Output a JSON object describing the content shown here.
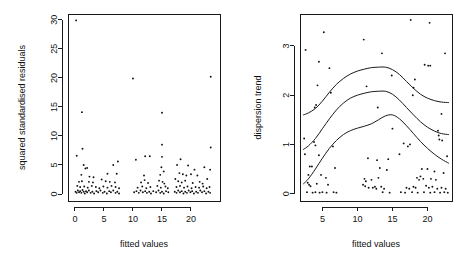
{
  "figure": {
    "title": "",
    "panel_count": 2,
    "background_color": "#ffffff",
    "foreground_color": "#111111"
  },
  "chart_data": [
    {
      "id": "left-panel",
      "type": "scatter",
      "title": "",
      "xlabel": "fitted values",
      "ylabel": "squared standardised residuals",
      "xlim": [
        -1.2,
        25.0
      ],
      "ylim": [
        -1.2,
        31.0
      ],
      "xticks": [
        0,
        5,
        10,
        15,
        20
      ],
      "yticks": [
        0,
        5,
        10,
        15,
        20,
        25,
        30
      ],
      "xticklabels": [
        "0",
        "5",
        "10",
        "15",
        "20"
      ],
      "yticklabels": [
        "0",
        "5",
        "10",
        "15",
        "20",
        "25",
        "30"
      ],
      "grid": false,
      "legend": "none",
      "point_marker": "dot",
      "points": [
        [
          0.2,
          29.9
        ],
        [
          1.2,
          14.1
        ],
        [
          1.3,
          7.8
        ],
        [
          0.3,
          6.6
        ],
        [
          10.0,
          19.9
        ],
        [
          15.0,
          14.0
        ],
        [
          23.4,
          20.2
        ],
        [
          23.4,
          8.0
        ],
        [
          15.0,
          8.5
        ],
        [
          12.1,
          6.5
        ],
        [
          12.9,
          6.5
        ],
        [
          15.0,
          6.4
        ],
        [
          10.5,
          5.9
        ],
        [
          7.4,
          5.6
        ],
        [
          1.5,
          5.0
        ],
        [
          6.6,
          5.0
        ],
        [
          18.2,
          6.0
        ],
        [
          23.3,
          4.2
        ],
        [
          2.1,
          4.5
        ],
        [
          1.8,
          4.4
        ],
        [
          17.6,
          5.0
        ],
        [
          19.5,
          4.9
        ],
        [
          20.6,
          4.2
        ],
        [
          22.3,
          4.6
        ],
        [
          14.9,
          4.6
        ],
        [
          15.3,
          3.9
        ],
        [
          5.6,
          3.5
        ],
        [
          7.2,
          3.5
        ],
        [
          1.1,
          3.3
        ],
        [
          2.5,
          3.0
        ],
        [
          3.2,
          2.9
        ],
        [
          18.0,
          3.6
        ],
        [
          18.6,
          3.4
        ],
        [
          19.2,
          3.2
        ],
        [
          20.0,
          3.4
        ],
        [
          21.1,
          3.2
        ],
        [
          11.9,
          3.2
        ],
        [
          14.7,
          3.3
        ],
        [
          17.3,
          2.6
        ],
        [
          22.8,
          2.6
        ],
        [
          0.7,
          2.1
        ],
        [
          1.2,
          2.2
        ],
        [
          2.4,
          2.1
        ],
        [
          3.1,
          2.0
        ],
        [
          4.6,
          2.5
        ],
        [
          5.3,
          2.2
        ],
        [
          6.0,
          2.1
        ],
        [
          6.9,
          2.0
        ],
        [
          11.4,
          2.0
        ],
        [
          12.0,
          2.4
        ],
        [
          12.6,
          1.9
        ],
        [
          14.5,
          2.3
        ],
        [
          15.1,
          2.1
        ],
        [
          15.4,
          1.8
        ],
        [
          17.8,
          2.2
        ],
        [
          18.4,
          2.0
        ],
        [
          19.0,
          2.3
        ],
        [
          20.3,
          1.9
        ],
        [
          21.5,
          2.1
        ],
        [
          22.0,
          1.8
        ],
        [
          0.4,
          1.4
        ],
        [
          0.9,
          1.2
        ],
        [
          1.6,
          1.3
        ],
        [
          2.2,
          1.1
        ],
        [
          2.9,
          1.4
        ],
        [
          3.6,
          1.2
        ],
        [
          4.2,
          1.0
        ],
        [
          4.9,
          1.3
        ],
        [
          5.6,
          1.1
        ],
        [
          6.3,
          1.4
        ],
        [
          7.0,
          1.2
        ],
        [
          7.6,
          1.0
        ],
        [
          10.8,
          1.1
        ],
        [
          11.6,
          1.3
        ],
        [
          12.3,
          1.0
        ],
        [
          13.0,
          1.2
        ],
        [
          14.2,
          1.4
        ],
        [
          14.8,
          1.1
        ],
        [
          15.6,
          1.3
        ],
        [
          16.0,
          1.0
        ],
        [
          17.5,
          1.2
        ],
        [
          18.1,
          1.4
        ],
        [
          18.8,
          1.1
        ],
        [
          19.4,
          1.3
        ],
        [
          20.1,
          1.0
        ],
        [
          20.8,
          1.2
        ],
        [
          21.4,
          1.1
        ],
        [
          22.1,
          1.3
        ],
        [
          22.7,
          1.0
        ],
        [
          23.2,
          1.2
        ],
        [
          0.1,
          0.4
        ],
        [
          0.3,
          0.2
        ],
        [
          0.5,
          0.6
        ],
        [
          0.7,
          0.3
        ],
        [
          0.9,
          0.5
        ],
        [
          1.1,
          0.2
        ],
        [
          1.3,
          0.7
        ],
        [
          1.5,
          0.4
        ],
        [
          1.7,
          0.1
        ],
        [
          1.9,
          0.5
        ],
        [
          2.1,
          0.3
        ],
        [
          2.4,
          0.6
        ],
        [
          2.7,
          0.2
        ],
        [
          3.0,
          0.4
        ],
        [
          3.3,
          0.1
        ],
        [
          3.7,
          0.5
        ],
        [
          4.0,
          0.3
        ],
        [
          4.4,
          0.6
        ],
        [
          4.8,
          0.2
        ],
        [
          5.1,
          0.4
        ],
        [
          5.5,
          0.1
        ],
        [
          5.9,
          0.5
        ],
        [
          6.2,
          0.3
        ],
        [
          6.6,
          0.6
        ],
        [
          7.0,
          0.2
        ],
        [
          7.3,
          0.4
        ],
        [
          7.6,
          0.1
        ],
        [
          10.2,
          0.3
        ],
        [
          10.6,
          0.5
        ],
        [
          11.0,
          0.2
        ],
        [
          11.3,
          0.6
        ],
        [
          11.7,
          0.3
        ],
        [
          12.1,
          0.5
        ],
        [
          12.4,
          0.2
        ],
        [
          12.8,
          0.4
        ],
        [
          13.1,
          0.1
        ],
        [
          13.5,
          0.5
        ],
        [
          14.0,
          0.3
        ],
        [
          14.4,
          0.6
        ],
        [
          14.7,
          0.2
        ],
        [
          15.0,
          0.4
        ],
        [
          15.3,
          0.1
        ],
        [
          15.7,
          0.5
        ],
        [
          16.1,
          0.3
        ],
        [
          17.2,
          0.4
        ],
        [
          17.5,
          0.2
        ],
        [
          17.8,
          0.6
        ],
        [
          18.1,
          0.3
        ],
        [
          18.4,
          0.5
        ],
        [
          18.7,
          0.1
        ],
        [
          19.0,
          0.4
        ],
        [
          19.3,
          0.2
        ],
        [
          19.6,
          0.6
        ],
        [
          19.9,
          0.3
        ],
        [
          20.2,
          0.5
        ],
        [
          20.5,
          0.1
        ],
        [
          20.9,
          0.4
        ],
        [
          21.2,
          0.2
        ],
        [
          21.6,
          0.6
        ],
        [
          21.9,
          0.3
        ],
        [
          22.3,
          0.5
        ],
        [
          22.6,
          0.1
        ],
        [
          23.0,
          0.4
        ],
        [
          23.3,
          0.2
        ]
      ]
    },
    {
      "id": "right-panel",
      "type": "scatter",
      "title": "",
      "xlabel": "fitted values",
      "ylabel": "dispersion trend",
      "xlim": [
        1.8,
        23.5
      ],
      "ylim": [
        -0.15,
        3.65
      ],
      "xticks": [
        5,
        10,
        15,
        20
      ],
      "yticks": [
        0,
        1,
        2,
        3
      ],
      "xticklabels": [
        "5",
        "10",
        "15",
        "20"
      ],
      "yticklabels": [
        "0",
        "1",
        "2",
        "3"
      ],
      "grid": false,
      "legend": "none",
      "point_marker": "dot",
      "curve_count": 3,
      "curves": [
        {
          "name": "upper-quantile-trend",
          "points": [
            [
              2.3,
              1.6
            ],
            [
              3.0,
              1.64
            ],
            [
              4.0,
              1.73
            ],
            [
              5.0,
              1.88
            ],
            [
              6.0,
              2.06
            ],
            [
              7.0,
              2.22
            ],
            [
              8.0,
              2.34
            ],
            [
              9.0,
              2.43
            ],
            [
              10.0,
              2.49
            ],
            [
              11.0,
              2.53
            ],
            [
              12.0,
              2.56
            ],
            [
              13.0,
              2.57
            ],
            [
              14.0,
              2.57
            ],
            [
              15.0,
              2.52
            ],
            [
              16.0,
              2.42
            ],
            [
              17.0,
              2.28
            ],
            [
              18.0,
              2.14
            ],
            [
              19.0,
              2.02
            ],
            [
              20.0,
              1.94
            ],
            [
              21.0,
              1.89
            ],
            [
              22.0,
              1.86
            ],
            [
              23.0,
              1.85
            ]
          ]
        },
        {
          "name": "median-trend",
          "points": [
            [
              2.3,
              0.9
            ],
            [
              3.0,
              0.97
            ],
            [
              4.0,
              1.12
            ],
            [
              5.0,
              1.32
            ],
            [
              6.0,
              1.52
            ],
            [
              7.0,
              1.7
            ],
            [
              8.0,
              1.84
            ],
            [
              9.0,
              1.94
            ],
            [
              10.0,
              2.0
            ],
            [
              11.0,
              2.04
            ],
            [
              12.0,
              2.07
            ],
            [
              13.0,
              2.08
            ],
            [
              14.0,
              2.08
            ],
            [
              15.0,
              2.02
            ],
            [
              16.0,
              1.9
            ],
            [
              17.0,
              1.75
            ],
            [
              18.0,
              1.6
            ],
            [
              19.0,
              1.46
            ],
            [
              20.0,
              1.35
            ],
            [
              21.0,
              1.27
            ],
            [
              22.0,
              1.22
            ],
            [
              23.0,
              1.2
            ]
          ]
        },
        {
          "name": "lower-quantile-trend",
          "points": [
            [
              2.3,
              0.2
            ],
            [
              3.0,
              0.3
            ],
            [
              4.0,
              0.5
            ],
            [
              5.0,
              0.72
            ],
            [
              6.0,
              0.92
            ],
            [
              7.0,
              1.08
            ],
            [
              8.0,
              1.2
            ],
            [
              9.0,
              1.28
            ],
            [
              10.0,
              1.33
            ],
            [
              11.0,
              1.37
            ],
            [
              12.0,
              1.42
            ],
            [
              13.0,
              1.5
            ],
            [
              14.0,
              1.58
            ],
            [
              15.0,
              1.6
            ],
            [
              16.0,
              1.52
            ],
            [
              17.0,
              1.38
            ],
            [
              18.0,
              1.22
            ],
            [
              19.0,
              1.06
            ],
            [
              20.0,
              0.92
            ],
            [
              21.0,
              0.8
            ],
            [
              22.0,
              0.7
            ],
            [
              23.0,
              0.62
            ]
          ]
        }
      ],
      "points": [
        [
          17.6,
          3.53
        ],
        [
          20.3,
          3.47
        ],
        [
          5.2,
          3.28
        ],
        [
          10.9,
          3.13
        ],
        [
          2.6,
          2.92
        ],
        [
          13.5,
          2.85
        ],
        [
          22.5,
          2.85
        ],
        [
          4.5,
          2.68
        ],
        [
          19.6,
          2.62
        ],
        [
          20.1,
          2.6
        ],
        [
          20.4,
          2.6
        ],
        [
          6.0,
          2.55
        ],
        [
          14.9,
          2.4
        ],
        [
          18.2,
          2.32
        ],
        [
          4.3,
          2.2
        ],
        [
          11.3,
          2.18
        ],
        [
          18.0,
          2.15
        ],
        [
          6.2,
          2.05
        ],
        [
          17.9,
          2.0
        ],
        [
          4.1,
          1.8
        ],
        [
          12.9,
          1.75
        ],
        [
          3.9,
          1.75
        ],
        [
          22.0,
          1.62
        ],
        [
          15.0,
          1.32
        ],
        [
          21.5,
          1.28
        ],
        [
          21.6,
          1.18
        ],
        [
          21.7,
          1.1
        ],
        [
          22.1,
          1.08
        ],
        [
          2.4,
          1.12
        ],
        [
          3.8,
          1.05
        ],
        [
          4.0,
          0.98
        ],
        [
          6.5,
          0.96
        ],
        [
          16.6,
          1.02
        ],
        [
          17.2,
          0.96
        ],
        [
          17.5,
          1.0
        ],
        [
          2.5,
          0.8
        ],
        [
          4.5,
          0.78
        ],
        [
          16.0,
          0.8
        ],
        [
          11.5,
          0.72
        ],
        [
          12.8,
          0.68
        ],
        [
          14.4,
          0.7
        ],
        [
          22.8,
          0.76
        ],
        [
          3.2,
          0.55
        ],
        [
          3.5,
          0.55
        ],
        [
          6.8,
          0.52
        ],
        [
          13.2,
          0.52
        ],
        [
          14.2,
          0.48
        ],
        [
          19.2,
          0.5
        ],
        [
          20.0,
          0.5
        ],
        [
          21.0,
          0.45
        ],
        [
          22.3,
          0.42
        ],
        [
          3.0,
          0.38
        ],
        [
          4.8,
          0.38
        ],
        [
          5.5,
          0.32
        ],
        [
          11.0,
          0.3
        ],
        [
          11.2,
          0.25
        ],
        [
          12.0,
          0.28
        ],
        [
          13.0,
          0.32
        ],
        [
          18.5,
          0.32
        ],
        [
          18.8,
          0.28
        ],
        [
          19.0,
          0.35
        ],
        [
          19.4,
          0.3
        ],
        [
          20.5,
          0.3
        ],
        [
          21.2,
          0.28
        ],
        [
          2.9,
          0.22
        ],
        [
          3.1,
          0.18
        ],
        [
          3.3,
          0.15
        ],
        [
          4.2,
          0.2
        ],
        [
          5.8,
          0.18
        ],
        [
          10.8,
          0.18
        ],
        [
          11.1,
          0.15
        ],
        [
          11.6,
          0.12
        ],
        [
          12.2,
          0.12
        ],
        [
          12.5,
          0.14
        ],
        [
          12.7,
          0.1
        ],
        [
          13.4,
          0.14
        ],
        [
          13.8,
          0.1
        ],
        [
          17.0,
          0.12
        ],
        [
          17.4,
          0.1
        ],
        [
          18.0,
          0.14
        ],
        [
          18.3,
          0.12
        ],
        [
          19.8,
          0.16
        ],
        [
          20.2,
          0.12
        ],
        [
          20.7,
          0.14
        ],
        [
          21.4,
          0.1
        ],
        [
          22.0,
          0.12
        ],
        [
          22.6,
          0.1
        ],
        [
          2.8,
          0.03
        ],
        [
          3.6,
          0.02
        ],
        [
          4.0,
          0.03
        ],
        [
          4.6,
          0.02
        ],
        [
          5.0,
          0.03
        ],
        [
          5.6,
          0.02
        ],
        [
          6.6,
          0.03
        ],
        [
          7.0,
          0.02
        ],
        [
          13.6,
          0.03
        ],
        [
          14.6,
          0.02
        ],
        [
          16.2,
          0.03
        ],
        [
          16.8,
          0.02
        ],
        [
          17.8,
          0.03
        ],
        [
          18.6,
          0.02
        ],
        [
          19.5,
          0.03
        ],
        [
          20.4,
          0.02
        ],
        [
          21.0,
          0.03
        ],
        [
          21.8,
          0.02
        ],
        [
          22.4,
          0.03
        ],
        [
          22.9,
          0.02
        ]
      ]
    }
  ]
}
